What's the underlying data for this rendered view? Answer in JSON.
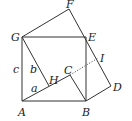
{
  "diagram": {
    "points": {
      "A": {
        "label": "A",
        "x": 22,
        "y": 101
      },
      "B": {
        "label": "B",
        "x": 86,
        "y": 101
      },
      "E": {
        "label": "E",
        "x": 86,
        "y": 37
      },
      "G": {
        "label": "G",
        "x": 22,
        "y": 37
      },
      "F": {
        "label": "F",
        "x": 69,
        "y": 9
      },
      "D": {
        "label": "D",
        "x": 111,
        "y": 86
      },
      "C": {
        "label": "C",
        "x": 70,
        "y": 75
      },
      "H": {
        "label": "H",
        "x": 49,
        "y": 86
      },
      "I": {
        "label": "I",
        "x": 98,
        "y": 58
      }
    },
    "side_labels": {
      "a": "a",
      "b": "b",
      "c": "c"
    },
    "stroke_color": "#333333"
  }
}
